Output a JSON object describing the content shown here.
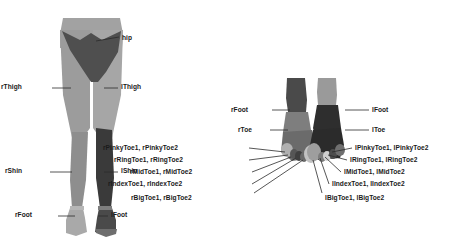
{
  "figure": {
    "background": "#ffffff",
    "width": 459,
    "height": 243
  },
  "colors": {
    "hip": "#4f4f4f",
    "thigh_light": "#9c9c9c",
    "shin_right": "#8e8e8e",
    "shin_left": "#3a3a3a",
    "foot_light": "#b4b4b4",
    "foot_dark": "#2e2e2e",
    "toe_mid": "#7a7a7a",
    "toe_light": "#c2c2c2",
    "leader_line": "#2b2b2b",
    "label_text": "#1a1a1a"
  },
  "legs_panel": {
    "name": "legs-diagram",
    "labels": [
      {
        "id": "hip",
        "text": "hip",
        "align": "left",
        "x": 122,
        "y": 35,
        "lx1": 96,
        "ly1": 41,
        "lx2": 119,
        "ly2": 37
      },
      {
        "id": "rThigh",
        "text": "rThigh",
        "align": "right",
        "x": 22,
        "y": 84,
        "lx1": 52,
        "ly1": 88,
        "lx2": 71,
        "ly2": 88
      },
      {
        "id": "lThigh",
        "text": "lThigh",
        "align": "left",
        "x": 121,
        "y": 84,
        "lx1": 104,
        "ly1": 88,
        "lx2": 118,
        "ly2": 88
      },
      {
        "id": "rShin",
        "text": "rShin",
        "align": "right",
        "x": 22,
        "y": 168,
        "lx1": 50,
        "ly1": 172,
        "lx2": 72,
        "ly2": 172
      },
      {
        "id": "lShin",
        "text": "lShin",
        "align": "left",
        "x": 121,
        "y": 168,
        "lx1": 104,
        "ly1": 172,
        "lx2": 118,
        "ly2": 172
      },
      {
        "id": "rFoot",
        "text": "rFoot",
        "align": "right",
        "x": 32,
        "y": 212,
        "lx1": 58,
        "ly1": 216,
        "lx2": 75,
        "ly2": 216
      },
      {
        "id": "lFoot",
        "text": "lFoot",
        "align": "left",
        "x": 111,
        "y": 212,
        "lx1": 98,
        "ly1": 216,
        "lx2": 108,
        "ly2": 216
      }
    ]
  },
  "feet_panel": {
    "name": "feet-diagram",
    "right_foot_labels": [
      {
        "id": "rFoot",
        "text": "rFoot",
        "align": "right",
        "x": 248,
        "y": 107,
        "lx1": 272,
        "ly1": 110,
        "lx2": 290,
        "ly2": 110
      },
      {
        "id": "rToe",
        "text": "rToe",
        "align": "right",
        "x": 252,
        "y": 127,
        "lx1": 270,
        "ly1": 130,
        "lx2": 288,
        "ly2": 130
      },
      {
        "id": "rPinkyToe",
        "text": "rPinkyToe1, rPinkyToe2",
        "align": "right",
        "x": 178,
        "y": 145,
        "lx1": 249,
        "ly1": 148,
        "lx2": 285,
        "ly2": 152
      },
      {
        "id": "rRingToe",
        "text": "rRingToe1, rRingToe2",
        "align": "right",
        "x": 183,
        "y": 157,
        "lx1": 249,
        "ly1": 160,
        "lx2": 288,
        "ly2": 155
      },
      {
        "id": "rMidToe",
        "text": "rMidToe1, rMidToe2",
        "align": "right",
        "x": 192,
        "y": 169,
        "lx1": 252,
        "ly1": 172,
        "lx2": 291,
        "ly2": 157
      },
      {
        "id": "rIndexToe",
        "text": "rIndexToe1, rIndexToe2",
        "align": "right",
        "x": 182,
        "y": 181,
        "lx1": 252,
        "ly1": 184,
        "lx2": 296,
        "ly2": 158
      },
      {
        "id": "rBigToe",
        "text": "rBigToe1, rBigToe2",
        "align": "right",
        "x": 192,
        "y": 195,
        "lx1": 254,
        "ly1": 193,
        "lx2": 303,
        "ly2": 160
      }
    ],
    "left_foot_labels": [
      {
        "id": "lFoot",
        "text": "lFoot",
        "align": "left",
        "x": 372,
        "y": 107,
        "lx1": 345,
        "ly1": 110,
        "lx2": 369,
        "ly2": 110
      },
      {
        "id": "lToe",
        "text": "lToe",
        "align": "left",
        "x": 372,
        "y": 127,
        "lx1": 345,
        "ly1": 130,
        "lx2": 369,
        "ly2": 130
      },
      {
        "id": "lPinkyToe",
        "text": "lPinkyToe1, lPinkyToe2",
        "align": "left",
        "x": 355,
        "y": 145,
        "lx1": 332,
        "ly1": 152,
        "lx2": 352,
        "ly2": 148
      },
      {
        "id": "lRingToe",
        "text": "lRingToe1, lRingToe2",
        "align": "left",
        "x": 350,
        "y": 157,
        "lx1": 328,
        "ly1": 155,
        "lx2": 347,
        "ly2": 160
      },
      {
        "id": "lMidToe",
        "text": "lMidToe1, lMidToe2",
        "align": "left",
        "x": 344,
        "y": 169,
        "lx1": 325,
        "ly1": 157,
        "lx2": 341,
        "ly2": 172
      },
      {
        "id": "lIndexToe",
        "text": "lIndexToe1, lIndexToe2",
        "align": "left",
        "x": 332,
        "y": 181,
        "lx1": 320,
        "ly1": 158,
        "lx2": 329,
        "ly2": 184
      },
      {
        "id": "lBigToe",
        "text": "lBigToe1, lBigToe2",
        "align": "left",
        "x": 325,
        "y": 195,
        "lx1": 313,
        "ly1": 160,
        "lx2": 322,
        "ly2": 193
      }
    ]
  }
}
